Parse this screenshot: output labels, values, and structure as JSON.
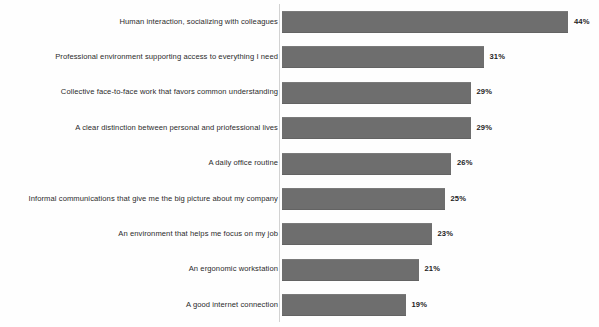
{
  "chart_data": {
    "type": "bar",
    "orientation": "horizontal",
    "title": "",
    "subtitle": "",
    "xlabel": "",
    "ylabel": "",
    "xlim": [
      0,
      44
    ],
    "grid": false,
    "legend": null,
    "value_suffix": "%",
    "bar_color": "#6e6e6e",
    "axis_color": "#d2d2d2",
    "categories": [
      "Human interaction, socializing with colleagues",
      "Professional environment supporting access to everything I need",
      "Collective face-to-face work that favors common understanding",
      "A clear distinction between personal and priofessional lives",
      "A daily office routine",
      "Informal communications that give me the big picture about my company",
      "An environment that helps me focus on my job",
      "An ergonomic workstation",
      "A good internet connection"
    ],
    "values": [
      44,
      31,
      29,
      29,
      26,
      25,
      23,
      21,
      19
    ],
    "value_labels": [
      "44%",
      "31%",
      "29%",
      "29%",
      "26%",
      "25%",
      "23%",
      "21%",
      "19%"
    ]
  }
}
